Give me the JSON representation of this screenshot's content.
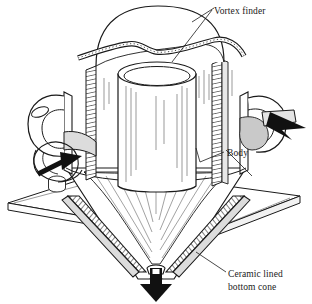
{
  "figure": {
    "background_color": "#ffffff",
    "ink_color": "#1a1a1a",
    "fill_color": "#ffffff",
    "arrow_color": "#111111",
    "shading_color": "#8a8a8a"
  },
  "labels": {
    "vortex_finder": "Vortex finder",
    "body": "Body",
    "bottom_cone_line1": "Ceramic lined",
    "bottom_cone_line2": "bottom cone"
  },
  "flow": {
    "inlet_arrow": "inlet-flow-arrow",
    "outlet_arrow": "outlet-flow-arrow",
    "discharge_arrow": "discharge-flow-arrow"
  },
  "parts": {
    "top_dome": "top-dome",
    "vortex_finder_tube": "vortex-finder-tube",
    "cylindrical_body": "cylindrical-body",
    "inlet_scroll": "inlet-scroll",
    "outlet_duct": "outlet-duct",
    "mounting_flange": "mounting-flange",
    "bottom_cone": "bottom-cone",
    "apex_discharge": "apex-discharge"
  }
}
